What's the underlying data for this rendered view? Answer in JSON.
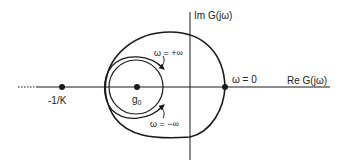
{
  "diagram": {
    "type": "nyquist-plot",
    "axes": {
      "real_label": "Re G(jω)",
      "imag_label": "Im G(jω)"
    },
    "points": {
      "critical": {
        "label": "-1/K"
      },
      "center": {
        "label": "g",
        "subscript": "0"
      },
      "zero_freq": {
        "label": "ω = 0"
      }
    },
    "annotations": {
      "plus_inf": "ω = +∞",
      "minus_inf": "ω = −∞"
    },
    "colors": {
      "stroke": "#1a1a1a",
      "background": "#ffffff"
    }
  }
}
